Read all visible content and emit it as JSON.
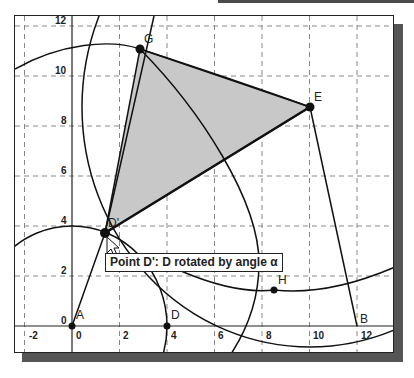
{
  "window": {
    "title": "Geometry construction canvas"
  },
  "axes": {
    "x_ticks": [
      "-2",
      "0",
      "2",
      "4",
      "6",
      "8",
      "10",
      "12"
    ],
    "y_ticks": [
      "0",
      "2",
      "4",
      "6",
      "8",
      "10",
      "12"
    ]
  },
  "points": {
    "A": {
      "label": "A",
      "x": 0,
      "y": 0
    },
    "D": {
      "label": "D",
      "x": 4,
      "y": 0
    },
    "B": {
      "label": "B",
      "x": 11.8,
      "y": 0
    },
    "Dprime": {
      "label": "D'",
      "x": 1.3,
      "y": 3.7
    },
    "G": {
      "label": "G",
      "x": 2.9,
      "y": 11.1
    },
    "E": {
      "label": "E",
      "x": 9.9,
      "y": 8.8
    },
    "H": {
      "label": "H",
      "x": 8.4,
      "y": 1.4
    }
  },
  "tooltip": {
    "text": "Point D': D rotated by angle α"
  },
  "colors": {
    "polygon_fill": "#c8c8c8",
    "stroke": "#111111",
    "grid": "#888888"
  }
}
